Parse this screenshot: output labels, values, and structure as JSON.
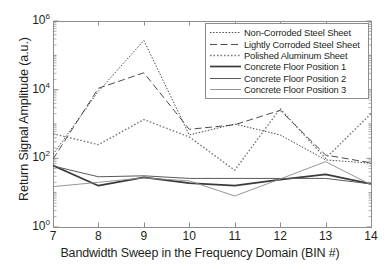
{
  "chart_data": {
    "type": "line",
    "title": "",
    "xlabel": "Bandwidth Sweep in the Frequency Domain (BIN #)",
    "ylabel": "Return Signal Amplitude (a.u.)",
    "yscale": "log",
    "xlim": [
      7,
      14
    ],
    "ylim": [
      1,
      1000000
    ],
    "xticks": [
      "7",
      "8",
      "9",
      "10",
      "11",
      "12",
      "13",
      "14"
    ],
    "yticks": [
      "10^0",
      "10^2",
      "10^4",
      "10^6"
    ],
    "ytick_mantissa": [
      "10",
      "10",
      "10"
    ],
    "grid": false,
    "legend_position": "upper right",
    "x": [
      7,
      8,
      9,
      10,
      11,
      12,
      13,
      14
    ],
    "series": [
      {
        "name": "Non-Corroded Steel Sheet",
        "style": "dashdot",
        "color": "#4d4d4d",
        "width": 1.0,
        "values": [
          130,
          9000,
          270000,
          480,
          1000,
          480,
          90,
          72
        ]
      },
      {
        "name": "Lightly Corroded Steel Sheet",
        "style": "dashed",
        "color": "#4d4d4d",
        "width": 1.0,
        "values": [
          95,
          11000,
          31000,
          700,
          950,
          2500,
          125,
          74
        ]
      },
      {
        "name": "Polished Aluminum Sheet",
        "style": "dotted",
        "color": "#7a7a7a",
        "width": 1.4,
        "values": [
          520,
          250,
          1350,
          420,
          45,
          2800,
          100,
          2000
        ]
      },
      {
        "name": "Concrete Floor Position 1",
        "style": "solid",
        "color": "#3a3a3a",
        "width": 1.7,
        "values": [
          62,
          16,
          28,
          19,
          16,
          24,
          34,
          18
        ]
      },
      {
        "name": "Concrete Floor Position 2",
        "style": "solid",
        "color": "#595959",
        "width": 1.0,
        "values": [
          60,
          29,
          31,
          26,
          26,
          26,
          26,
          18
        ]
      },
      {
        "name": "Concrete Floor Position 3",
        "style": "solid",
        "color": "#8a8a8a",
        "width": 0.9,
        "values": [
          15,
          20,
          27,
          22,
          8,
          25,
          80,
          17
        ]
      }
    ]
  },
  "legend": {
    "items": [
      "Non-Corroded Steel Sheet",
      "Lightly Corroded Steel Sheet",
      "Polished Aluminum Sheet",
      "Concrete Floor Position 1",
      "Concrete Floor Position 2",
      "Concrete Floor Position 3"
    ]
  }
}
